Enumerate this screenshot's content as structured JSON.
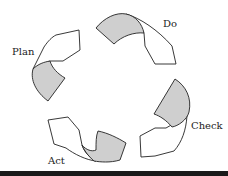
{
  "diagram": {
    "stages": [
      {
        "id": "plan",
        "label": "Plan"
      },
      {
        "id": "do",
        "label": "Do"
      },
      {
        "id": "check",
        "label": "Check"
      },
      {
        "id": "act",
        "label": "Act"
      }
    ],
    "colors": {
      "fill_gray": "#cfcfcf",
      "fill_white": "#ffffff",
      "stroke": "#222222",
      "bottom_bar": "#1a1a1a"
    }
  }
}
